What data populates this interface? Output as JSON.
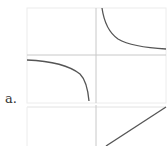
{
  "figure": {
    "label": "a.",
    "panels": [
      {
        "name": "upper-panel",
        "function": "reciprocal-hyperbola",
        "description": "Two hyperbola branches with vertical asymptote at x=0 and horizontal asymptote at y=0"
      },
      {
        "name": "lower-panel",
        "function": "increasing-line",
        "description": "Straight line with positive slope"
      }
    ]
  },
  "colors": {
    "grid": "#e6e6e6",
    "axis": "#c8c8c8",
    "curve": "#555555",
    "label": "#333333"
  }
}
